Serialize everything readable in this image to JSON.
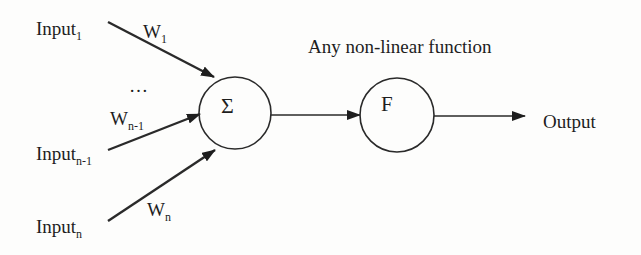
{
  "diagram": {
    "inputs": [
      {
        "id": "input-1",
        "label": "Input",
        "subscript": "1",
        "weight_label": "W",
        "weight_subscript": "1"
      },
      {
        "id": "input-n-1",
        "label": "Input",
        "subscript": "n-1",
        "weight_label": "W",
        "weight_subscript": "n-1"
      },
      {
        "id": "input-n",
        "label": "Input",
        "subscript": "n",
        "weight_label": "W",
        "weight_subscript": "n"
      }
    ],
    "ellipsis": "…",
    "summation_node": {
      "symbol": "Σ"
    },
    "activation_node": {
      "symbol": "F",
      "caption": "Any non-linear function"
    },
    "output_label": "Output",
    "colors": {
      "stroke": "#2a2a2a",
      "text": "#1e1e1e",
      "background": "#fdfdfc"
    }
  }
}
